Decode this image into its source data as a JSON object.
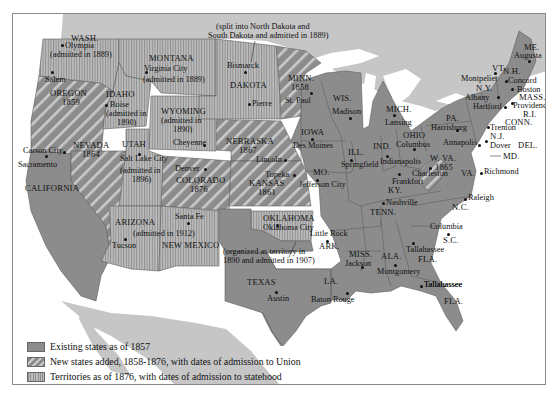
{
  "map": {
    "colors": {
      "existing": "#8c8c8c",
      "new_state_hatch": "#c9c9c9",
      "territory_stripe": "#bdbdbd",
      "foreign_land": "#c6c6c6",
      "water": "#ffffff",
      "border": "#5e5e5e"
    },
    "legend": {
      "items": [
        {
          "swatch": "existing",
          "label": "Existing states as of 1857"
        },
        {
          "swatch": "new",
          "label": "New states added, 1858-1876, with dates of admission to Union"
        },
        {
          "swatch": "territory",
          "label": "Territories as of 1876, with dates of admission to statehood"
        },
        {
          "swatch": "dot",
          "label": "State and territorial capitals"
        }
      ]
    },
    "territories": [
      {
        "name": "WASH.",
        "capital": "Olympia",
        "note": "(admitted in 1889)"
      },
      {
        "name": "MONTANA",
        "capital": "Virginia City",
        "note": "(admitted in 1889)"
      },
      {
        "name": "DAKOTA",
        "capitals": [
          "Bismarck",
          "Pierre"
        ],
        "note_line1": "(split into North Dakota and",
        "note_line2": "South Dakota and admitted in 1889)"
      },
      {
        "name": "IDAHO",
        "capital": "Boise",
        "note_line1": "(admitted in",
        "note_line2": "1890)"
      },
      {
        "name": "WYOMING",
        "capital": "Cheyenne",
        "note_line1": "(admitted in",
        "note_line2": "1890)"
      },
      {
        "name": "UTAH",
        "capital": "Salt Lake City",
        "note_line1": "(admitted in",
        "note_line2": "1896)"
      },
      {
        "name": "ARIZONA",
        "capital": "Tucson",
        "note": "(admitted in 1912)"
      },
      {
        "name": "NEW MEXICO",
        "capital": "Santa Fe"
      },
      {
        "name": "OKLAHOMA",
        "capital": "Oklahoma City",
        "note_line1": "(organized as territory in",
        "note_line2": "1890 and admitted in 1907)"
      }
    ],
    "new_states": [
      {
        "name": "OREGON",
        "year": "1859",
        "capital": "Salem"
      },
      {
        "name": "NEVADA",
        "year": "1864",
        "capital": "Carson City"
      },
      {
        "name": "COLORADO",
        "year": "1876",
        "capital": "Denver"
      },
      {
        "name": "NEBRASKA",
        "year": "1867",
        "capital": "Lincoln"
      },
      {
        "name": "KANSAS",
        "year": "1861",
        "capital": "Topeka"
      },
      {
        "name": "MINN.",
        "year": "1858",
        "capital": "St. Paul"
      },
      {
        "name": "W. VA.",
        "year": "1865",
        "capital": "Charleston"
      }
    ],
    "existing_states": [
      {
        "name": "CALIFORNIA",
        "capital": "Sacramento"
      },
      {
        "name": "TEXAS",
        "capital": "Austin"
      },
      {
        "name": "IOWA",
        "capital": "Des Moines"
      },
      {
        "name": "MO.",
        "capital": "Jefferson City"
      },
      {
        "name": "ARK.",
        "capital": "Little Rock"
      },
      {
        "name": "LA.",
        "capital": "Baton Rouge"
      },
      {
        "name": "WIS.",
        "capital": "Madison"
      },
      {
        "name": "ILL.",
        "capital": "Springfield"
      },
      {
        "name": "MICH.",
        "capital": "Lansing"
      },
      {
        "name": "IND.",
        "capital": "Indianapolis"
      },
      {
        "name": "OHIO",
        "capital": "Columbus"
      },
      {
        "name": "KY.",
        "capital": "Frankfort"
      },
      {
        "name": "TENN.",
        "capital": "Nashville"
      },
      {
        "name": "MISS.",
        "capital": "Jackson"
      },
      {
        "name": "ALA.",
        "capital": "Montgomery"
      },
      {
        "name": "GA.",
        "capital": "Atlanta"
      },
      {
        "name": "FLA.",
        "capital": "Tallahassee"
      },
      {
        "name": "S.C.",
        "capital": "Columbia"
      },
      {
        "name": "N.C.",
        "capital": "Raleigh"
      },
      {
        "name": "VA.",
        "capital": "Richmond"
      },
      {
        "name": "MD.",
        "capital": "Annapolis"
      },
      {
        "name": "DEL.",
        "capital": "Dover"
      },
      {
        "name": "N.J.",
        "capital": "Trenton"
      },
      {
        "name": "PA.",
        "capital": "Harrisburg"
      },
      {
        "name": "N.Y.",
        "capital": "Albany"
      },
      {
        "name": "CONN.",
        "capital": "Hartford"
      },
      {
        "name": "R.I.",
        "capital": "Providence"
      },
      {
        "name": "MASS.",
        "capital": "Boston"
      },
      {
        "name": "VT.",
        "capital": "Montpelier"
      },
      {
        "name": "N.H.",
        "capital": "Concord"
      },
      {
        "name": "ME.",
        "capital": "Augusta"
      }
    ]
  }
}
